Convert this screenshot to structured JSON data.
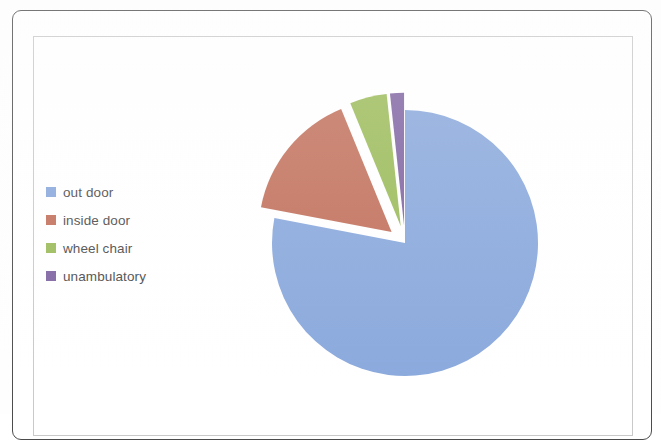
{
  "document": {
    "type": "scanned-chart-page",
    "background_color": "#ffffff",
    "outer_frame_color": "#4c4c4c",
    "inner_frame_color": "#c9c9c9"
  },
  "legend": {
    "position": "left",
    "items": [
      {
        "label": "out door",
        "color": "#89A8DC",
        "swatch_name": "legend-swatch-out-door"
      },
      {
        "label": "inside door",
        "color": "#C2705B",
        "swatch_name": "legend-swatch-inside-door"
      },
      {
        "label": "wheel chair",
        "color": "#9BBB59",
        "swatch_name": "legend-swatch-wheel-chair"
      },
      {
        "label": "unambulatory",
        "color": "#8064A2",
        "swatch_name": "legend-swatch-unambulatory"
      }
    ]
  },
  "chart_data": {
    "type": "pie",
    "title": "",
    "subtitle": "",
    "xlabel": "",
    "ylabel": "",
    "exploded": true,
    "start_angle_deg": 0,
    "direction": "clockwise",
    "legend_position": "left",
    "grid": false,
    "categories": [
      "out door",
      "inside door",
      "wheel chair",
      "unambulatory"
    ],
    "values": [
      78,
      15.8,
      4.5,
      1.7
    ],
    "units": "percent",
    "colors": [
      "#89A8DC",
      "#C2705B",
      "#9BBB59",
      "#8064A2"
    ],
    "slices": [
      {
        "label": "out door",
        "value": 78,
        "angle_deg": 280.8,
        "color": "#89A8DC",
        "explode": 0.0
      },
      {
        "label": "inside door",
        "value": 15.8,
        "angle_deg": 56.9,
        "color": "#C2705B",
        "explode": 0.13
      },
      {
        "label": "wheel chair",
        "value": 4.5,
        "angle_deg": 16.2,
        "color": "#9BBB59",
        "explode": 0.13
      },
      {
        "label": "unambulatory",
        "value": 1.7,
        "angle_deg": 6.1,
        "color": "#8064A2",
        "explode": 0.13
      }
    ]
  },
  "geometry": {
    "center_x": 405,
    "center_y": 243,
    "radius": 133
  }
}
